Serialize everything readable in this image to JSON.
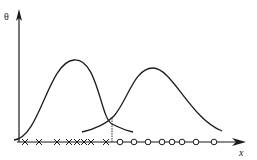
{
  "diagram": {
    "y_axis_label": "θ",
    "x_axis_label": "x",
    "colors": {
      "stroke": "#1a1a1a",
      "background": "#ffffff"
    },
    "x_marks": [
      25,
      39,
      57,
      69,
      77,
      84,
      91,
      106
    ],
    "o_marks": [
      120,
      134,
      148,
      162,
      172,
      182,
      196,
      214
    ],
    "threshold_x": 112,
    "curves": [
      {
        "name": "left-distribution",
        "peak_x": 74,
        "peak_y": 60
      },
      {
        "name": "right-distribution",
        "peak_x": 153,
        "peak_y": 68
      }
    ]
  }
}
